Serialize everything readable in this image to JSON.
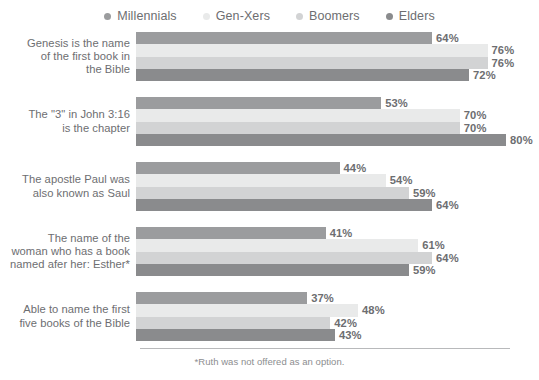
{
  "legend": {
    "items": [
      {
        "label": "Millennials",
        "color": "#9b9c9e"
      },
      {
        "label": "Gen-Xers",
        "color": "#e9eaea"
      },
      {
        "label": "Boomers",
        "color": "#d2d3d4"
      },
      {
        "label": "Elders",
        "color": "#8a8b8d"
      }
    ]
  },
  "footnote": "*Ruth was not offered as an option.",
  "chart_data": {
    "type": "bar",
    "orientation": "horizontal",
    "title": "",
    "xlabel": "",
    "ylabel": "",
    "xlim": [
      0,
      80
    ],
    "grid": false,
    "legend_position": "top-center",
    "value_suffix": "%",
    "categories": [
      "Genesis is the name of the first book in the Bible",
      "The \"3\" in John 3:16 is the chapter",
      "The apostle Paul was also known as Saul",
      "The name of the woman who has a book named afer her: Esther*",
      "Able to name the first five books of the Bible"
    ],
    "category_lines": [
      [
        "Genesis is the name",
        "of the first book in",
        "the Bible"
      ],
      [
        "The \"3\" in John 3:16",
        "is the chapter"
      ],
      [
        "The apostle Paul was",
        "also known as Saul"
      ],
      [
        "The name of the",
        "woman who has a book",
        "named afer her: Esther*"
      ],
      [
        "Able to name the first",
        "five books of the Bible"
      ]
    ],
    "series": [
      {
        "name": "Millennials",
        "color": "#9b9c9e",
        "values": [
          64,
          53,
          44,
          41,
          37
        ]
      },
      {
        "name": "Gen-Xers",
        "color": "#e9eaea",
        "values": [
          76,
          70,
          54,
          61,
          48
        ]
      },
      {
        "name": "Boomers",
        "color": "#d2d3d4",
        "values": [
          76,
          70,
          59,
          64,
          42
        ]
      },
      {
        "name": "Elders",
        "color": "#8a8b8d",
        "values": [
          72,
          80,
          64,
          59,
          43
        ]
      }
    ],
    "labels": [
      [
        "64%",
        "76%",
        "76%",
        "72%"
      ],
      [
        "53%",
        "70%",
        "70%",
        "80%"
      ],
      [
        "44%",
        "54%",
        "59%",
        "64%"
      ],
      [
        "41%",
        "61%",
        "64%",
        "59%"
      ],
      [
        "37%",
        "48%",
        "42%",
        "43%"
      ]
    ]
  }
}
